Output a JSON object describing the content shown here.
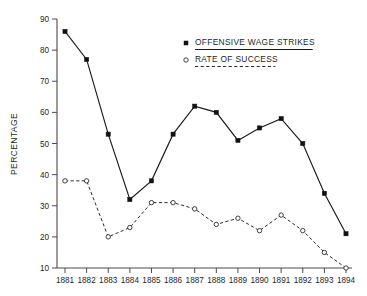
{
  "chart_data": {
    "type": "line",
    "title": "",
    "xlabel": "",
    "ylabel": "PERCENTAGE",
    "x": [
      1881,
      1882,
      1883,
      1884,
      1885,
      1886,
      1887,
      1888,
      1889,
      1890,
      1891,
      1892,
      1893,
      1894
    ],
    "categories": [
      "1881",
      "1882",
      "1883",
      "1884",
      "1885",
      "1886",
      "1887",
      "1888",
      "1889",
      "1890",
      "1891",
      "1892",
      "1893",
      "1894"
    ],
    "series": [
      {
        "name": "OFFENSIVE WAGE STRIKES",
        "marker": "filled-square",
        "line_style": "solid",
        "color": "#1a1a1a",
        "values": [
          86,
          77,
          53,
          32,
          38,
          53,
          62,
          60,
          51,
          55,
          58,
          50,
          34,
          21
        ]
      },
      {
        "name": "RATE OF SUCCESS",
        "marker": "open-circle",
        "line_style": "dashed",
        "color": "#2b2b2b",
        "values": [
          38,
          38,
          20,
          23,
          31,
          31,
          29,
          24,
          26,
          22,
          27,
          22,
          15,
          10
        ]
      }
    ],
    "ylim": [
      10,
      90
    ],
    "yticks": [
      10,
      20,
      30,
      40,
      50,
      60,
      70,
      80,
      90
    ],
    "ytick_labels": [
      "10",
      "20",
      "30",
      "40",
      "50",
      "60",
      "70",
      "80",
      "90"
    ],
    "xlim": [
      1881,
      1894
    ],
    "grid": false,
    "legend_position": "top-right",
    "legend": [
      "OFFENSIVE WAGE STRIKES",
      "RATE OF SUCCESS"
    ],
    "background_color": "#ffffff",
    "axis_color": "#4a4a4a"
  }
}
